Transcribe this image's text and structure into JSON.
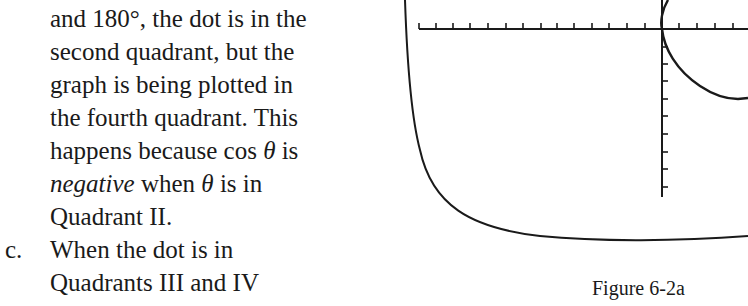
{
  "text": {
    "lines": [
      {
        "parts": [
          "and 180°, the dot is in the"
        ]
      },
      {
        "parts": [
          "second quadrant, but the"
        ]
      },
      {
        "parts": [
          "graph is being plotted in"
        ]
      },
      {
        "parts": [
          "the fourth quadrant. This"
        ]
      },
      {
        "pre": "happens because cos ",
        "theta": "θ",
        "post": " is"
      },
      {
        "ital": "negative",
        "mid": " when ",
        "theta": "θ",
        "post": " is in"
      },
      {
        "parts": [
          "Quadrant II."
        ]
      },
      {
        "marker": "c.",
        "parts": [
          "When the dot is in"
        ]
      },
      {
        "parts": [
          "Quadrants III and IV"
        ]
      }
    ]
  },
  "figure": {
    "caption": "Figure 6-2a",
    "axis_color": "#1a1a1a"
  }
}
